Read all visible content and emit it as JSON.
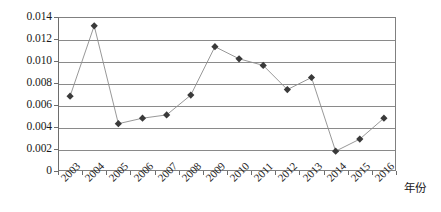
{
  "chart_data": {
    "type": "line",
    "title": "",
    "subtitle": "",
    "xlabel": "年份",
    "ylabel": "",
    "categories": [
      "2003",
      "2004",
      "2005",
      "2006",
      "2007",
      "2008",
      "2009",
      "2010",
      "2011",
      "2012",
      "2013",
      "2014",
      "2015",
      "2016"
    ],
    "values": [
      0.0068,
      0.0132,
      0.0043,
      0.0048,
      0.0051,
      0.0069,
      0.0113,
      0.0102,
      0.0096,
      0.0074,
      0.0085,
      0.0018,
      0.0029,
      0.0048
    ],
    "series": [
      {
        "name": "",
        "values": [
          0.0068,
          0.0132,
          0.0043,
          0.0048,
          0.0051,
          0.0069,
          0.0113,
          0.0102,
          0.0096,
          0.0074,
          0.0085,
          0.0018,
          0.0029,
          0.0048
        ]
      }
    ],
    "ylim": [
      0,
      0.014
    ],
    "ytick_values": [
      0,
      0.002,
      0.004,
      0.006,
      0.008,
      0.01,
      0.012,
      0.014
    ],
    "ytick_labels": [
      "0",
      "0.002",
      "0.004",
      "0.006",
      "0.008",
      "0.010",
      "0.012",
      "0.014"
    ],
    "grid": true,
    "grid_axis": "y",
    "legend": false,
    "legend_position": "none",
    "marker": "diamond",
    "colors": {
      "marker": "#3a3a3a",
      "line": "#8c8c8c",
      "grid": "#8a8a8a",
      "axis": "#6d6d6d",
      "text": "#1a1a1a",
      "background": "#ffffff"
    }
  }
}
